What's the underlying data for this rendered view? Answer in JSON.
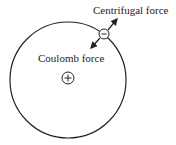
{
  "diagram": {
    "labels": {
      "centrifugal": "Centrifugal force",
      "coulomb": "Coulomb force"
    },
    "electron_sign": "−",
    "nucleus_sign": "+",
    "colors": {
      "stroke": "#222222",
      "background": "#ffffff"
    }
  }
}
